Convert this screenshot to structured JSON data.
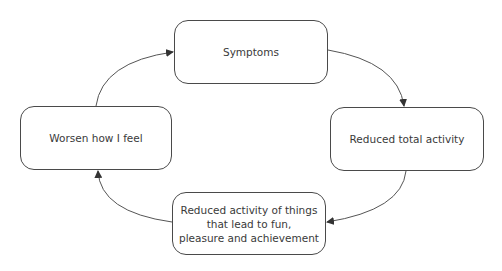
{
  "diagram": {
    "type": "cycle",
    "colors": {
      "stroke": "#4a4a4a",
      "text": "#3a3a3a",
      "background": "#ffffff"
    },
    "nodes": [
      {
        "id": "symptoms",
        "label": "Symptoms"
      },
      {
        "id": "reduced-total",
        "label": "Reduced total activity"
      },
      {
        "id": "reduced-fun",
        "label": "Reduced activity of things\nthat lead to fun,\npleasure and achievement"
      },
      {
        "id": "worsen",
        "label": "Worsen how I feel"
      }
    ],
    "edges": [
      {
        "from": "symptoms",
        "to": "reduced-total"
      },
      {
        "from": "reduced-total",
        "to": "reduced-fun"
      },
      {
        "from": "reduced-fun",
        "to": "worsen"
      },
      {
        "from": "worsen",
        "to": "symptoms"
      }
    ]
  }
}
